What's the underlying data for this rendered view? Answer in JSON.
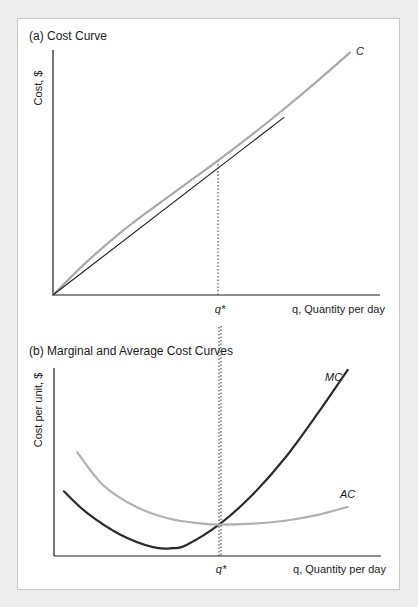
{
  "colors": {
    "background": "#ececec",
    "panel": "#ffffff",
    "axis": "#1a1a1a",
    "cost_curve": "#a8a8a8",
    "tangent_line": "#1a1a1a",
    "mc_curve": "#2a2a2a",
    "ac_curve": "#b0b0b0"
  },
  "chart_data": [
    {
      "type": "line",
      "title": "(a) Cost Curve",
      "xlabel": "q, Quantity per day",
      "ylabel": "Cost, $",
      "x_tick_labels": [
        "q*"
      ],
      "grid": false,
      "xlim": [
        0,
        10
      ],
      "ylim": [
        0,
        10
      ],
      "q_star": 5.0,
      "series": [
        {
          "name": "C",
          "label": "C",
          "x": [
            0,
            1,
            2,
            3,
            4,
            5,
            6,
            7,
            8,
            9
          ],
          "y": [
            0,
            1.35,
            2.55,
            3.6,
            4.6,
            5.6,
            6.65,
            7.75,
            8.9,
            10.1
          ]
        },
        {
          "name": "tangent-ray",
          "label": "",
          "x": [
            0,
            7.0
          ],
          "y": [
            0,
            7.4
          ]
        }
      ],
      "annotations": [
        {
          "text": "q*",
          "type": "dotted-vertical",
          "x": 5.0
        }
      ]
    },
    {
      "type": "line",
      "title": "(b) Marginal and Average Cost Curves",
      "xlabel": "q, Quantity per day",
      "ylabel": "Cost per unit, $",
      "x_tick_labels": [
        "q*"
      ],
      "grid": false,
      "xlim": [
        0,
        10
      ],
      "ylim": [
        0,
        10
      ],
      "q_star": 5.0,
      "series": [
        {
          "name": "MC",
          "label": "MC",
          "x": [
            0.3,
            1,
            2,
            3,
            3.6,
            4,
            5,
            6,
            7,
            8,
            8.9
          ],
          "y": [
            3.3,
            2.2,
            1.1,
            0.45,
            0.4,
            0.55,
            1.6,
            3.1,
            5.0,
            7.3,
            9.5
          ]
        },
        {
          "name": "AC",
          "label": "AC",
          "x": [
            0.7,
            1.5,
            2.5,
            3.5,
            4.5,
            5.0,
            6,
            7,
            8,
            8.9
          ],
          "y": [
            5.3,
            3.6,
            2.5,
            1.9,
            1.65,
            1.6,
            1.65,
            1.8,
            2.1,
            2.5
          ]
        }
      ],
      "annotations": [
        {
          "text": "q*",
          "type": "dotted-vertical",
          "x": 5.0
        }
      ]
    }
  ]
}
